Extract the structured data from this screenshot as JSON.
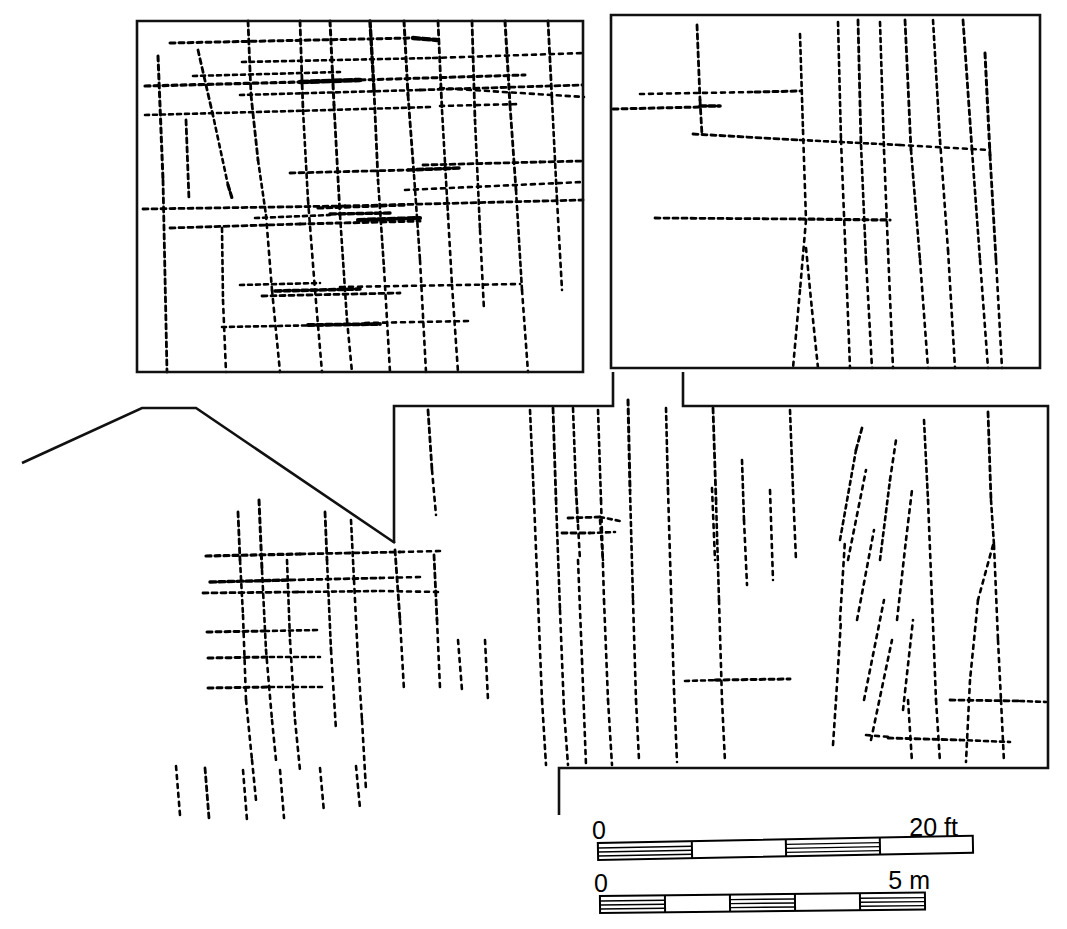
{
  "figure": {
    "kind": "archaeological-site-plan",
    "background_color": "#ffffff",
    "ink_color": "#000000",
    "width": 1067,
    "height": 929
  },
  "scales": {
    "imperial": {
      "zero_label": "0",
      "max_label": "20 ft",
      "segments": 4,
      "bar_x": 598,
      "bar_y": 843,
      "bar_width": 375,
      "bar_height": 17,
      "tilt": -1.1
    },
    "metric": {
      "zero_label": "0",
      "max_label": "5 m",
      "segments": 5,
      "bar_x": 600,
      "bar_y": 896,
      "bar_width": 325,
      "bar_height": 17,
      "tilt": -0.6
    }
  },
  "areas": [
    {
      "name": "upper-left-excavation-block",
      "outline": "M137,21 L583,21 L583,372 L137,372 Z"
    },
    {
      "name": "upper-right-excavation-block",
      "outline": "M611,15 L1040,15 L1040,368 L611,368 Z"
    },
    {
      "name": "lower-right-excavation-block",
      "outline": "M683,372 L683,406 L1048,406 L1048,768 L559,768 L559,815"
    },
    {
      "name": "central-trench-boundary",
      "outline": "M613,372 L613,406 L394,406 L394,543"
    },
    {
      "name": "sloping-site-edge",
      "outline": "M22,463 L142,408 L196,408 L395,543"
    }
  ],
  "wall_groups": {
    "upper_left": {
      "label": "stippled wall lines, dense orthogonal grid",
      "count": 48
    },
    "upper_right": {
      "label": "stippled wall lines, vertical dominant",
      "count": 27
    },
    "lower_left": {
      "label": "stippled wall lines, orthogonal cluster",
      "count": 30
    },
    "lower_right": {
      "label": "stippled wall lines, vertical with diagonal groups",
      "count": 41
    }
  }
}
